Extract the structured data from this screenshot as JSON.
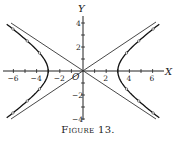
{
  "figure": {
    "caption": "Figure 13.",
    "x_axis_label": "X",
    "y_axis_label": "Y",
    "origin_label": "O",
    "x_tick_labels": [
      "-6",
      "-4",
      "-2",
      "2",
      "4",
      "6"
    ],
    "y_tick_labels": [
      "4",
      "2",
      "-2",
      "-4"
    ]
  },
  "chart_data": {
    "type": "line",
    "title": "Figure 13.",
    "xlabel": "X",
    "ylabel": "Y",
    "xlim": [
      -7,
      7
    ],
    "ylim": [
      -4.2,
      4.2
    ],
    "x_ticks": [
      -6,
      -5,
      -4,
      -3,
      -2,
      -1,
      0,
      1,
      2,
      3,
      4,
      5,
      6
    ],
    "y_ticks": [
      -4,
      -3,
      -2,
      -1,
      0,
      1,
      2,
      3,
      4
    ],
    "grid": false,
    "series": [
      {
        "name": "hyperbola x^2/9 - y^2/4 = 1 (right branch)",
        "points": [
          [
            3,
            0
          ],
          [
            3.6,
            1.33
          ],
          [
            4.24,
            2
          ],
          [
            5,
            2.67
          ],
          [
            5.41,
            3
          ],
          [
            6,
            3.46
          ],
          [
            6.32,
            3.7
          ]
        ]
      },
      {
        "name": "hyperbola x^2/9 - y^2/4 = 1 (left branch)",
        "points": [
          [
            -3,
            0
          ],
          [
            -3.6,
            1.33
          ],
          [
            -4.24,
            2
          ],
          [
            -5,
            2.67
          ],
          [
            -5.41,
            3
          ],
          [
            -6,
            3.46
          ],
          [
            -6.32,
            3.7
          ]
        ]
      },
      {
        "name": "asymptote y = 2x/3",
        "points": [
          [
            -6.3,
            -4.2
          ],
          [
            6.3,
            4.2
          ]
        ]
      },
      {
        "name": "asymptote y = -2x/3",
        "points": [
          [
            -6.3,
            4.2
          ],
          [
            6.3,
            -4.2
          ]
        ]
      }
    ],
    "vertices": [
      [
        -3,
        0
      ],
      [
        3,
        0
      ]
    ]
  }
}
